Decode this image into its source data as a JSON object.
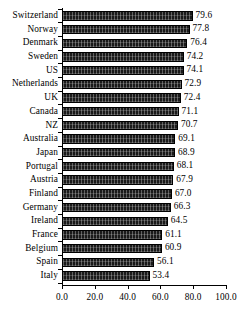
{
  "chart_data": {
    "type": "bar",
    "orientation": "horizontal",
    "title": "",
    "subtitle": "",
    "xlabel": "",
    "ylabel": "",
    "xlim": [
      0.0,
      100.0
    ],
    "xticks": [
      "0.0",
      "20.0",
      "40.0",
      "60.0",
      "80.0",
      "100.0"
    ],
    "xtick_values": [
      0.0,
      20.0,
      40.0,
      60.0,
      80.0,
      100.0
    ],
    "grid": false,
    "legend": false,
    "legend_position": "none",
    "data_labels": true,
    "bar_color": "#1a1a1a",
    "bar_edge_color": "#000000",
    "background_color": "#ffffff",
    "categories": [
      "Switzerland",
      "Norway",
      "Denmark",
      "Sweden",
      "US",
      "Netherlands",
      "UK",
      "Canada",
      "NZ",
      "Australia",
      "Japan",
      "Portugal",
      "Austria",
      "Finland",
      "Germany",
      "Ireland",
      "France",
      "Belgium",
      "Spain",
      "Italy"
    ],
    "values": [
      79.6,
      77.8,
      76.4,
      74.2,
      74.1,
      72.9,
      72.4,
      71.1,
      70.7,
      69.1,
      68.9,
      68.1,
      67.9,
      67.0,
      66.3,
      64.5,
      61.1,
      60.9,
      56.1,
      53.4
    ],
    "value_labels": [
      "79.6",
      "77.8",
      "76.4",
      "74.2",
      "74.1",
      "72.9",
      "72.4",
      "71.1",
      "70.7",
      "69.1",
      "68.9",
      "68.1",
      "67.9",
      "67.0",
      "66.3",
      "64.5",
      "61.1",
      "60.9",
      "56.1",
      "53.4"
    ]
  }
}
